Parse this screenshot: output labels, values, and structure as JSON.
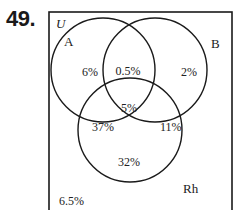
{
  "problem": {
    "number": "49."
  },
  "venn": {
    "universe_label": "U",
    "sets": [
      {
        "name": "A",
        "label": "A"
      },
      {
        "name": "B",
        "label": "B"
      },
      {
        "name": "Rh",
        "label": "Rh"
      }
    ],
    "regions": {
      "only_A": "6%",
      "A_and_B_only": "0.5%",
      "only_B": "2%",
      "A_B_Rh": "5%",
      "A_and_Rh_only": "37%",
      "B_and_Rh_only": "11%",
      "only_Rh": "32%",
      "none": "6.5%"
    },
    "colors": {
      "stroke": "#1a1a1a",
      "background": "#ffffff"
    }
  }
}
